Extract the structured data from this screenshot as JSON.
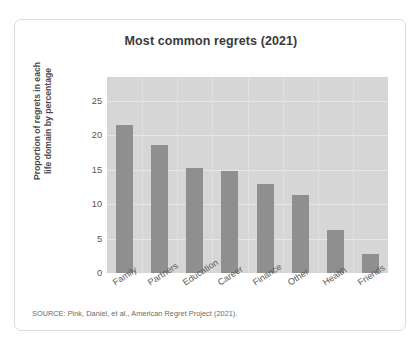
{
  "card": {
    "source_note": "SOURCE: Pink, Daniel, et al., American Regret Project (2021)."
  },
  "chart_data": {
    "type": "bar",
    "title": "Most common regrets (2021)",
    "xlabel": "",
    "ylabel": "Proportion of regrets in each life domain by percentage",
    "ylabel_line1": "Proportion of regrets in each",
    "ylabel_line2": "life domain by percentage",
    "categories": [
      "Family",
      "Partners",
      "Education",
      "Career",
      "Finance",
      "Other",
      "Health",
      "Friends"
    ],
    "values": [
      21.5,
      18.6,
      15.2,
      14.8,
      13.0,
      11.3,
      6.3,
      2.8
    ],
    "ylim": [
      0,
      28.5
    ],
    "yticks": [
      0,
      5,
      10,
      15,
      20,
      25
    ],
    "ytick_labels": [
      "0",
      "5",
      "10",
      "15",
      "20",
      "25"
    ],
    "grid": true,
    "legend": "none",
    "colors": {
      "bar": "#8f8f8f",
      "plot_background": "#d6d6d6",
      "gridline": "#e6e6e6",
      "card_background": "#ffffff",
      "card_border": "#dcdcdc",
      "title_text": "#3a3a3a"
    }
  }
}
